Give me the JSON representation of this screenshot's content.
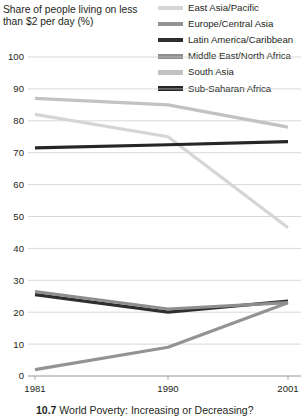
{
  "axis_title": "Share of people living on less than $2 per day (%)",
  "caption": "10.7  World Poverty: Increasing or Decreasing?",
  "legend": {
    "items": [
      {
        "label": "East Asia/Pacific",
        "color": "#d5d5d5"
      },
      {
        "label": "Europe/Central Asia",
        "color": "#939393"
      },
      {
        "label": "Latin America/Caribbean",
        "color": "#2f2f2f"
      },
      {
        "label": "Middle East/North Africa",
        "color": "#8e8e8e"
      },
      {
        "label": "South Asia",
        "color": "#c2c2c2"
      },
      {
        "label": "Sub-Saharan Africa",
        "color": "#262626"
      }
    ]
  },
  "chart_data": {
    "type": "line",
    "title": "Share of people living on less than $2 per day (%)",
    "xlabel": "",
    "ylabel": "Share of people living on less than $2 per day (%)",
    "x": [
      "1981",
      "1990",
      "2001"
    ],
    "ylim": [
      0,
      100
    ],
    "yticks": [
      0,
      10,
      20,
      30,
      40,
      50,
      60,
      70,
      80,
      90,
      100
    ],
    "grid": true,
    "legend_position": "top-right",
    "series": [
      {
        "name": "East Asia/Pacific",
        "color": "#d5d5d5",
        "values": [
          82.0,
          75.0,
          46.5
        ]
      },
      {
        "name": "Europe/Central Asia",
        "color": "#939393",
        "values": [
          2.0,
          9.0,
          23.0
        ]
      },
      {
        "name": "Latin America/Caribbean",
        "color": "#2f2f2f",
        "values": [
          25.5,
          20.0,
          23.5
        ]
      },
      {
        "name": "Middle East/North Africa",
        "color": "#8e8e8e",
        "values": [
          26.5,
          21.0,
          23.0
        ]
      },
      {
        "name": "South Asia",
        "color": "#c2c2c2",
        "values": [
          87.0,
          85.0,
          78.0
        ]
      },
      {
        "name": "Sub-Saharan Africa",
        "color": "#262626",
        "values": [
          71.5,
          72.5,
          73.5
        ]
      }
    ]
  }
}
